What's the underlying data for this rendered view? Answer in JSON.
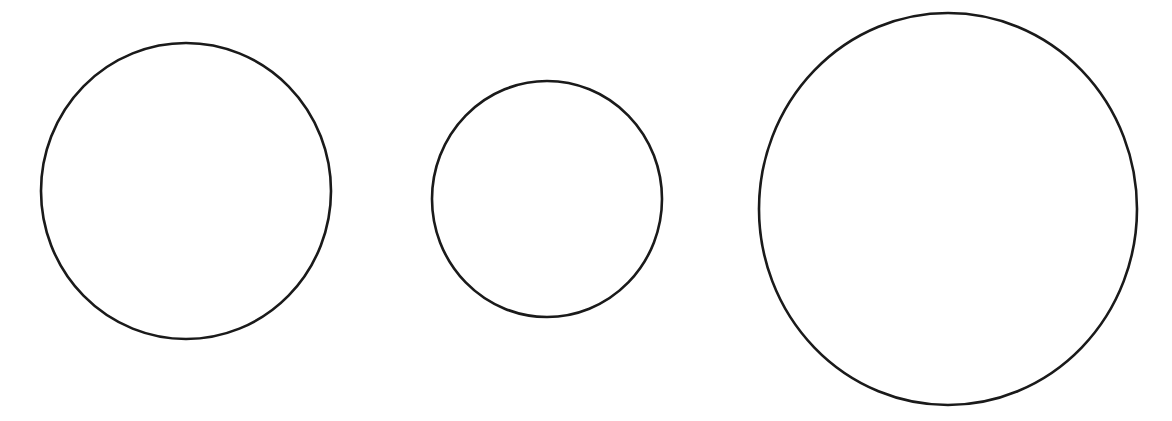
{
  "canvas": {
    "width": 1172,
    "height": 421,
    "background": "#ffffff"
  },
  "style": {
    "stroke": "#1a1a1a",
    "stroke_width": 2.6,
    "fill": "none"
  },
  "shapes": [
    {
      "type": "ellipse",
      "cx": 186,
      "cy": 191,
      "rx": 145,
      "ry": 148
    },
    {
      "type": "ellipse",
      "cx": 547,
      "cy": 199,
      "rx": 115,
      "ry": 118
    },
    {
      "type": "ellipse",
      "cx": 948,
      "cy": 209,
      "rx": 189,
      "ry": 196
    }
  ]
}
